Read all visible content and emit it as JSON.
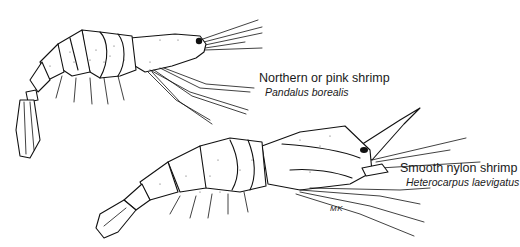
{
  "illustration": {
    "specimens": [
      {
        "common_name": "Northern or pink shrimp",
        "scientific_name": "Pandalus borealis"
      },
      {
        "common_name": "Smooth nylon shrimp",
        "scientific_name": "Heterocarpus laevigatus"
      }
    ],
    "artist_signature": "MK",
    "colors": {
      "background": "#ffffff",
      "ink": "#111111"
    }
  }
}
